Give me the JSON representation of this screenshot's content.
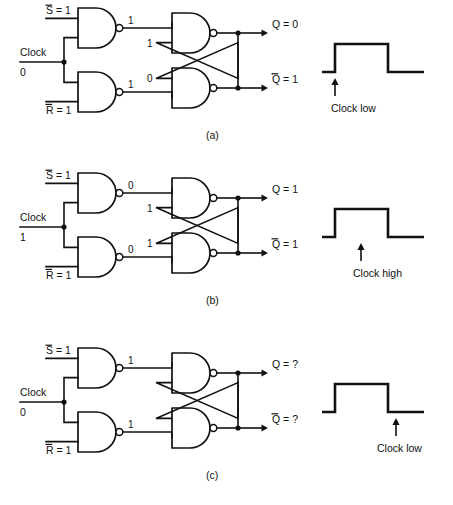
{
  "figure": {
    "type": "logic-circuit-diagram",
    "background": "#ffffff",
    "ink_color": "#111111"
  },
  "panels": [
    {
      "id": "a",
      "caption": "(a)",
      "inputs": {
        "set": {
          "label": "S = 1",
          "symbol": "S",
          "overbar": true,
          "value": "1"
        },
        "reset": {
          "label": "R = 1",
          "symbol": "R",
          "overbar": true,
          "value": "1"
        },
        "clock": {
          "label": "Clock",
          "value": "0"
        }
      },
      "gate_outputs": {
        "top_nand": "1",
        "bottom_nand": "1"
      },
      "feedback_labels": {
        "upper": "1",
        "lower": "0"
      },
      "outputs": {
        "q": {
          "label": "Q = 0",
          "symbol": "Q",
          "overbar": false,
          "value": "0"
        },
        "qbar": {
          "label": "Q = 1",
          "symbol": "Q",
          "overbar": true,
          "value": "1"
        }
      },
      "waveform": {
        "annotation": "Clock low",
        "arrow_at": "before-rising-edge",
        "arrow_x": 335,
        "label_x": 331,
        "points": "322,72 335,72 335,44 388,44 388,72 424,72"
      }
    },
    {
      "id": "b",
      "caption": "(b)",
      "inputs": {
        "set": {
          "label": "S = 1",
          "symbol": "S",
          "overbar": true,
          "value": "1"
        },
        "reset": {
          "label": "R = 1",
          "symbol": "R",
          "overbar": true,
          "value": "1"
        },
        "clock": {
          "label": "Clock",
          "value": "1"
        }
      },
      "gate_outputs": {
        "top_nand": "0",
        "bottom_nand": "0"
      },
      "feedback_labels": {
        "upper": "1",
        "lower": "1"
      },
      "outputs": {
        "q": {
          "label": "Q = 1",
          "symbol": "Q",
          "overbar": false,
          "value": "1"
        },
        "qbar": {
          "label": "Q = 1",
          "symbol": "Q",
          "overbar": true,
          "value": "1"
        }
      },
      "waveform": {
        "annotation": "Clock high",
        "arrow_at": "middle-of-high-pulse",
        "arrow_x": 361,
        "label_x": 353,
        "points": "322,72 335,72 335,44 388,44 388,72 424,72"
      }
    },
    {
      "id": "c",
      "caption": "(c)",
      "inputs": {
        "set": {
          "label": "S = 1",
          "symbol": "S",
          "overbar": true,
          "value": "1"
        },
        "reset": {
          "label": "R = 1",
          "symbol": "R",
          "overbar": true,
          "value": "1"
        },
        "clock": {
          "label": "Clock",
          "value": "0"
        }
      },
      "gate_outputs": {
        "top_nand": "1",
        "bottom_nand": "1"
      },
      "feedback_labels": {
        "upper": "",
        "lower": ""
      },
      "outputs": {
        "q": {
          "label": "Q = ?",
          "symbol": "Q",
          "overbar": false,
          "value": "?"
        },
        "qbar": {
          "label": "Q = ?",
          "symbol": "Q",
          "overbar": true,
          "value": "?"
        }
      },
      "waveform": {
        "annotation": "Clock low",
        "arrow_at": "after-falling-edge",
        "arrow_x": 396,
        "label_x": 377,
        "points": "322,72 335,72 335,44 388,44 388,72 424,72"
      }
    }
  ]
}
